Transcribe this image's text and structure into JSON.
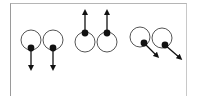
{
  "diagram": {
    "colors": {
      "outline": "#555555",
      "pupil": "#111111",
      "arrow": "#111111",
      "frame": "#9a9a9a"
    },
    "eye_radius": 10,
    "pupil_radius": 3.4,
    "pairs": [
      {
        "direction": "down",
        "eyes": [
          {
            "cx": 31,
            "cy": 40,
            "px": 31,
            "py": 48,
            "ax": 31,
            "ay": 68
          },
          {
            "cx": 53,
            "cy": 40,
            "px": 53,
            "py": 48,
            "ax": 53,
            "ay": 68
          }
        ]
      },
      {
        "direction": "up",
        "eyes": [
          {
            "cx": 85,
            "cy": 42,
            "px": 85,
            "py": 33,
            "ax": 85,
            "ay": 12
          },
          {
            "cx": 107,
            "cy": 42,
            "px": 107,
            "py": 33,
            "ax": 107,
            "ay": 12
          }
        ]
      },
      {
        "direction": "down-right",
        "eyes": [
          {
            "cx": 140,
            "cy": 37,
            "px": 144,
            "py": 43,
            "ax": 157,
            "ay": 56
          },
          {
            "cx": 162,
            "cy": 38,
            "px": 165,
            "py": 45,
            "ax": 180,
            "ay": 58
          }
        ]
      }
    ]
  }
}
